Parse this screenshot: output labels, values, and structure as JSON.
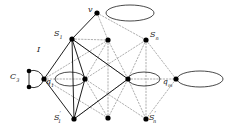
{
  "figure": {
    "background": "#ffffff",
    "stroke_solid": "#111111",
    "stroke_dotted": "#8c8c8c",
    "node_fill": "#000000",
    "width": 225,
    "height": 137
  },
  "labels": {
    "v": {
      "text": "v",
      "base": "v",
      "sub": "",
      "prime": "",
      "x": 88,
      "y": 8
    },
    "S1": {
      "text": "S1",
      "base": "S",
      "sub": "1",
      "prime": "",
      "x": 55,
      "y": 30
    },
    "Sn": {
      "text": "Sn",
      "base": "S",
      "sub": "n",
      "prime": "",
      "x": 150,
      "y": 31
    },
    "I": {
      "text": "I",
      "base": "I",
      "sub": "",
      "prime": "",
      "x": 38,
      "y": 47
    },
    "C3": {
      "text": "C3",
      "base": "C",
      "sub": "3",
      "prime": "",
      "x": 12,
      "y": 72
    },
    "q1": {
      "text": "q1",
      "base": "q",
      "sub": "1",
      "prime": "",
      "x": 45,
      "y": 78
    },
    "qm": {
      "text": "qm",
      "base": "q",
      "sub": "m",
      "prime": "",
      "x": 163,
      "y": 78
    },
    "S1prime": {
      "text": "S1'",
      "base": "S",
      "sub": "1",
      "prime": "′",
      "x": 55,
      "y": 110
    },
    "Snprime": {
      "text": "Sn'",
      "base": "S",
      "sub": "n",
      "prime": "′",
      "x": 148,
      "y": 110
    }
  },
  "nodes": [
    {
      "name": "v",
      "x": 97,
      "y": 13,
      "r": 2.6
    },
    {
      "name": "S1",
      "x": 72,
      "y": 39,
      "r": 2.6
    },
    {
      "name": "S-mid",
      "x": 108,
      "y": 40,
      "r": 2.6
    },
    {
      "name": "Sn",
      "x": 146,
      "y": 40,
      "r": 2.6
    },
    {
      "name": "q1",
      "x": 44,
      "y": 79,
      "r": 2.6
    },
    {
      "name": "mid-left",
      "x": 85,
      "y": 79,
      "r": 2.6
    },
    {
      "name": "mid-right",
      "x": 128,
      "y": 79,
      "r": 2.6
    },
    {
      "name": "qm",
      "x": 176,
      "y": 79,
      "r": 2.6
    },
    {
      "name": "S1prime",
      "x": 74,
      "y": 119,
      "r": 2.6
    },
    {
      "name": "Sprime-mid",
      "x": 108,
      "y": 118,
      "r": 2.6
    },
    {
      "name": "Snprime",
      "x": 146,
      "y": 119,
      "r": 2.6
    },
    {
      "name": "c3-top",
      "x": 29,
      "y": 71,
      "r": 2.3
    },
    {
      "name": "c3-bottom",
      "x": 29,
      "y": 87,
      "r": 2.3
    }
  ],
  "ellipses": [
    {
      "name": "ellipse-v",
      "cx": 130,
      "cy": 13,
      "rx": 24,
      "ry": 8
    },
    {
      "name": "ellipse-mid-left",
      "cx": 70,
      "cy": 79,
      "rx": 15,
      "ry": 7
    },
    {
      "name": "ellipse-mid-right",
      "cx": 144,
      "cy": 79,
      "rx": 16,
      "ry": 7
    },
    {
      "name": "ellipse-qm",
      "cx": 200,
      "cy": 79,
      "rx": 23,
      "ry": 8
    }
  ],
  "edges_solid": [
    {
      "from": "v",
      "to": "S1"
    },
    {
      "from": "S1",
      "to": "q1"
    },
    {
      "from": "S1",
      "to": "mid-left"
    },
    {
      "from": "S1",
      "to": "S1prime"
    },
    {
      "from": "S1",
      "to": "mid-right"
    },
    {
      "from": "q1",
      "to": "S1prime"
    },
    {
      "from": "mid-left",
      "to": "S1prime"
    },
    {
      "from": "S1prime",
      "to": "mid-right"
    }
  ],
  "edges_dotted": [
    {
      "from": "v",
      "to": "S-mid"
    },
    {
      "from": "v",
      "to": "Sn"
    },
    {
      "from": "S-mid",
      "to": "mid-left"
    },
    {
      "from": "S-mid",
      "to": "mid-right"
    },
    {
      "from": "S-mid",
      "to": "Sprime-mid"
    },
    {
      "from": "Sn",
      "to": "mid-right"
    },
    {
      "from": "Sn",
      "to": "qm"
    },
    {
      "from": "Sn",
      "to": "Snprime"
    },
    {
      "from": "q1",
      "to": "mid-left"
    },
    {
      "from": "q1",
      "to": "S-mid"
    },
    {
      "from": "mid-left",
      "to": "Snprime"
    },
    {
      "from": "mid-right",
      "to": "qm"
    },
    {
      "from": "mid-right",
      "to": "Snprime"
    },
    {
      "from": "Sprime-mid",
      "to": "mid-left"
    },
    {
      "from": "Sprime-mid",
      "to": "mid-right"
    },
    {
      "from": "Snprime",
      "to": "qm"
    },
    {
      "from": "S1",
      "to": "S-mid"
    }
  ],
  "c3_arcs": [
    {
      "name": "c3-arc-upper"
    },
    {
      "name": "c3-arc-lower"
    }
  ]
}
